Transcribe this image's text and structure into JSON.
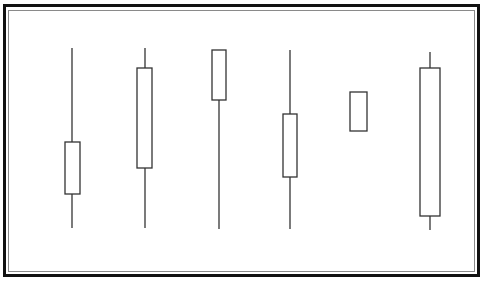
{
  "diagram": {
    "title": "",
    "colors": {
      "stroke": "#333333",
      "body_fill": "#ffffff",
      "frame_outer": "#111111",
      "frame_inner": "#8a8a8a"
    }
  },
  "chart_data": {
    "type": "candlestick",
    "title": "",
    "xlabel": "",
    "ylabel": "",
    "grid": false,
    "legend": null,
    "note": "Values are pixel-derived relative prices (higher = up); no axes or labels shown",
    "candles": [
      {
        "index": 1,
        "cx": 72,
        "body_left": 65,
        "body_width": 15,
        "high": 48,
        "body_top": 142,
        "body_bottom": 194,
        "low": 228
      },
      {
        "index": 2,
        "cx": 145,
        "body_left": 137,
        "body_width": 15,
        "high": 48,
        "body_top": 68,
        "body_bottom": 168,
        "low": 228
      },
      {
        "index": 3,
        "cx": 219,
        "body_left": 212,
        "body_width": 14,
        "high": 50,
        "body_top": 50,
        "body_bottom": 100,
        "low": 229
      },
      {
        "index": 4,
        "cx": 290,
        "body_left": 283,
        "body_width": 14,
        "high": 50,
        "body_top": 114,
        "body_bottom": 177,
        "low": 229
      },
      {
        "index": 5,
        "cx": 358,
        "body_left": 350,
        "body_width": 17,
        "high": 92,
        "body_top": 92,
        "body_bottom": 131,
        "low": 131
      },
      {
        "index": 6,
        "cx": 430,
        "body_left": 420,
        "body_width": 20,
        "high": 52,
        "body_top": 68,
        "body_bottom": 216,
        "low": 230
      }
    ]
  }
}
